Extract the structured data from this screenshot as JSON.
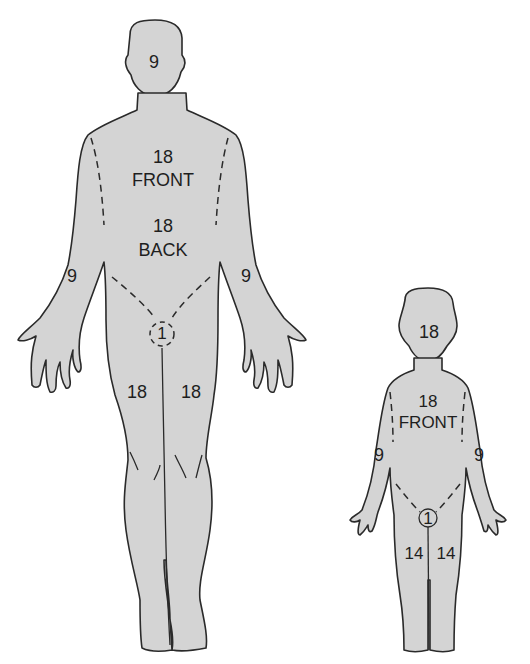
{
  "diagram": {
    "figures": [
      {
        "name": "adult",
        "regions": {
          "head": "9",
          "trunk_front_value": "18",
          "trunk_front_label": "FRONT",
          "trunk_back_value": "18",
          "trunk_back_label": "BACK",
          "arm_right": "9",
          "arm_left": "9",
          "perineum": "1",
          "leg_right": "18",
          "leg_left": "18"
        }
      },
      {
        "name": "child",
        "regions": {
          "head": "18",
          "trunk_front_value": "18",
          "trunk_front_label": "FRONT",
          "arm_right": "9",
          "arm_left": "9",
          "perineum": "1",
          "leg_right": "14",
          "leg_left": "14"
        }
      }
    ],
    "colors": {
      "body_fill": "#d4d4d4",
      "outline": "#2a2a2a",
      "background": "#ffffff"
    }
  }
}
